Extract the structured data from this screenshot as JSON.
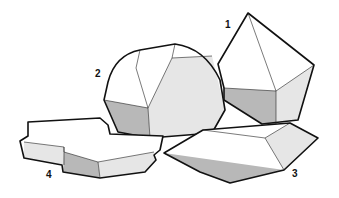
{
  "figure": {
    "colors": {
      "outline": "#111111",
      "dark_face": "#b8b8b8",
      "light_face": "#e6e6e6",
      "white_face": "#ffffff"
    },
    "crystals": [
      {
        "label": "1",
        "x": 225,
        "y": 28
      },
      {
        "label": "2",
        "x": 95,
        "y": 77
      },
      {
        "label": "3",
        "x": 292,
        "y": 177
      },
      {
        "label": "4",
        "x": 46,
        "y": 178
      }
    ]
  }
}
